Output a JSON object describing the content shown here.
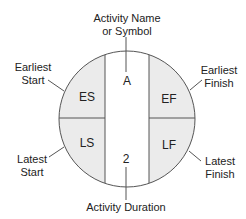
{
  "diagram": {
    "type": "activity-on-node circle",
    "callouts": {
      "top": [
        "Activity Name",
        "or Symbol"
      ],
      "top_left": [
        "Earliest",
        "Start"
      ],
      "top_right": [
        "Earliest",
        "Finish"
      ],
      "bottom_left": [
        "Latest",
        "Start"
      ],
      "bottom_right": [
        "Latest",
        "Finish"
      ],
      "bottom": [
        "Activity Duration"
      ]
    },
    "cells": {
      "es": "ES",
      "ef": "EF",
      "ls": "LS",
      "lf": "LF",
      "name": "A",
      "duration": "2"
    },
    "colors": {
      "stroke": "#555555",
      "quadrant_fill": "#ebebeb",
      "center_fill": "#ffffff"
    }
  }
}
